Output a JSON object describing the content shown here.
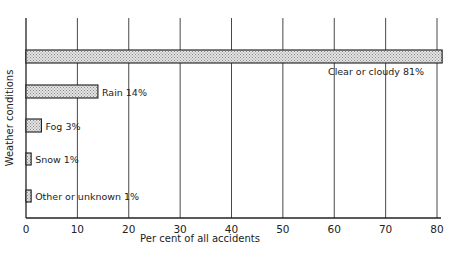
{
  "chart_data": {
    "type": "bar",
    "orientation": "horizontal",
    "title": "",
    "xlabel": "Per cent of all accidents",
    "ylabel": "Weather conditions",
    "xlim": [
      0,
      80
    ],
    "xticks": [
      0,
      10,
      20,
      30,
      40,
      50,
      60,
      70,
      80
    ],
    "grid": {
      "vertical": true,
      "horizontal": false
    },
    "legend": null,
    "categories": [
      "Clear or cloudy",
      "Rain",
      "Fog",
      "Snow",
      "Other or unknown"
    ],
    "values": [
      81,
      14,
      3,
      1,
      1
    ],
    "annotations": [
      "Clear or cloudy 81%",
      "Rain 14%",
      "Fog 3%",
      "Snow 1%",
      "Other or unknown 1%"
    ],
    "bar_fill": "stippled grey pattern"
  },
  "colors": {
    "axis": "#222222",
    "grid": "#333333",
    "bar_fill": "#cfcfcf",
    "bar_stroke": "#1a1a1a"
  }
}
